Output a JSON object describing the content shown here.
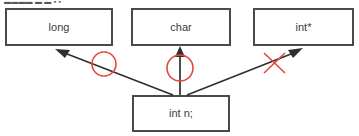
{
  "diagram": {
    "title_fragment": "▬▬▬▬ ▬ ▬ ▪ ▪",
    "colors": {
      "box_border": "#4a4a4a",
      "box_fill": "#ffffff",
      "arrow": "#2f2f2f",
      "annotation_red": "#e8453c",
      "text": "#3c3c3c"
    },
    "target_boxes": [
      {
        "id": "long",
        "label": "long"
      },
      {
        "id": "char",
        "label": "char"
      },
      {
        "id": "intptr",
        "label": "int*"
      }
    ],
    "source_box": {
      "id": "intn",
      "label": "int n;"
    },
    "edges": [
      {
        "from": "int n;",
        "to": "long",
        "annotation": "circle",
        "annotation_meaning": "allowed"
      },
      {
        "from": "int n;",
        "to": "char",
        "annotation": "circle",
        "annotation_meaning": "allowed"
      },
      {
        "from": "int n;",
        "to": "int*",
        "annotation": "cross",
        "annotation_meaning": "not-allowed"
      }
    ],
    "annotations": [
      {
        "id": "mark-left",
        "kind": "circle"
      },
      {
        "id": "mark-middle",
        "kind": "circle"
      },
      {
        "id": "mark-right",
        "kind": "cross"
      }
    ]
  }
}
